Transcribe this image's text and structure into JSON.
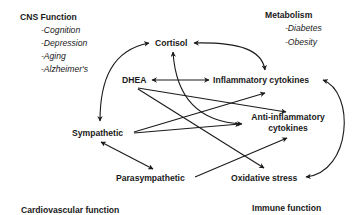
{
  "diagram": {
    "groups": {
      "cns": {
        "title": "CNS Function",
        "items": [
          "-Cognition",
          "-Depression",
          "-Aging",
          "-Alzheimer's"
        ]
      },
      "metabolism": {
        "title": "Metabolism",
        "items": [
          "-Diabetes",
          "-Obesity"
        ]
      },
      "cardiovascular": {
        "title": "Cardiovascular function"
      },
      "immune": {
        "title": "Immune function"
      }
    },
    "nodes": {
      "cortisol": "Cortisol",
      "dhea": "DHEA",
      "inflammatory": "Inflammatory cytokines",
      "sympathetic": "Sympathetic",
      "anti_inflammatory_line1": "Anti-inflammatory",
      "anti_inflammatory_line2": "cytokines",
      "parasympathetic": "Parasympathetic",
      "oxidative": "Oxidative stress"
    },
    "edges": [
      {
        "from": "Sympathetic",
        "to": "Cortisol",
        "type": "bidirectional-curve"
      },
      {
        "from": "Cortisol",
        "to": "Inflammatory cytokines",
        "type": "bidirectional-curve"
      },
      {
        "from": "Anti-inflammatory cytokines",
        "to": "Cortisol",
        "type": "bidirectional-curve"
      },
      {
        "from": "DHEA",
        "to": "Inflammatory cytokines",
        "type": "bidirectional"
      },
      {
        "from": "DHEA",
        "to": "Anti-inflammatory cytokines",
        "type": "directed"
      },
      {
        "from": "DHEA",
        "to": "Oxidative stress",
        "type": "directed"
      },
      {
        "from": "Sympathetic",
        "to": "Inflammatory cytokines",
        "type": "directed"
      },
      {
        "from": "Sympathetic",
        "to": "Anti-inflammatory cytokines",
        "type": "directed"
      },
      {
        "from": "Sympathetic",
        "to": "Parasympathetic",
        "type": "bidirectional"
      },
      {
        "from": "Parasympathetic",
        "to": "Anti-inflammatory cytokines",
        "type": "directed"
      },
      {
        "from": "Inflammatory cytokines",
        "to": "Oxidative stress",
        "type": "bidirectional-curve"
      }
    ],
    "colors": {
      "line": "#1a1a1a",
      "background": "#ffffff"
    }
  }
}
